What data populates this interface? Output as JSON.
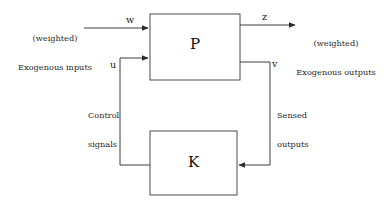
{
  "diagram": {
    "type": "block-diagram",
    "background_color": "#ffffff",
    "line_color": "#4a4a4a",
    "text_color": "#1a1a1a",
    "blocks": [
      {
        "id": "plant",
        "label": "P",
        "x": 150,
        "y": 14,
        "width": 90,
        "height": 66
      },
      {
        "id": "controller",
        "label": "K",
        "x": 150,
        "y": 131,
        "width": 87,
        "height": 64
      }
    ],
    "signals": {
      "w": "w",
      "z": "z",
      "u": "u",
      "v": "v"
    },
    "annotations": {
      "exogenous_inputs_line1": "(weighted)",
      "exogenous_inputs_line2": "Exogenous inputs",
      "exogenous_outputs_line1": "(weighted)",
      "exogenous_outputs_line2": "Exogenous outputs",
      "control_signals_line1": "Control",
      "control_signals_line2": "signals",
      "sensed_outputs_line1": "Sensed",
      "sensed_outputs_line2": "outputs"
    },
    "connections": [
      {
        "id": "w-into-plant",
        "from": "exogenous-inputs",
        "to": "plant",
        "label": "w",
        "direction": "right"
      },
      {
        "id": "z-out-of-plant",
        "from": "plant",
        "to": "exogenous-outputs",
        "label": "z",
        "direction": "right"
      },
      {
        "id": "v-plant-to-controller",
        "from": "plant",
        "to": "controller",
        "label": "v",
        "direction": "down-then-left"
      },
      {
        "id": "u-controller-to-plant",
        "from": "controller",
        "to": "plant",
        "label": "u",
        "direction": "left-then-up-then-right"
      }
    ]
  }
}
